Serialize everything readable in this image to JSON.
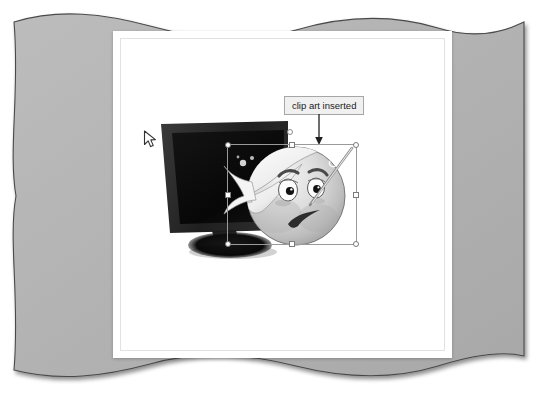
{
  "scene": {
    "kind": "document-page-with-selected-clipart",
    "background_color": "#ffffff",
    "backdrop_color": "#b4b4b4",
    "page_color": "#ffffff",
    "page_border_color": "#e2e2e2"
  },
  "backdrop": {
    "name": "wavy-gray-frame",
    "fill": "#b4b4b4",
    "stroke": "#4d4d4d",
    "edge_style": "wavy"
  },
  "callout": {
    "label": "clip art inserted",
    "fill": "#f0f0f0",
    "border_color": "#a6a6a6",
    "text_color": "#1a1a1a",
    "arrow_color": "#1a1a1a",
    "arrow_direction": "down"
  },
  "selection": {
    "label": "clip-art-selection",
    "border_color": "#9a9a9a",
    "handle_fill": "#ffffff",
    "handle_border": "#7a7a7a",
    "handle_count": 8,
    "handles": [
      {
        "position": "top-left",
        "shape": "circle"
      },
      {
        "position": "top-middle",
        "shape": "square"
      },
      {
        "position": "top-right",
        "shape": "circle"
      },
      {
        "position": "middle-left",
        "shape": "square"
      },
      {
        "position": "middle-right",
        "shape": "square"
      },
      {
        "position": "bottom-left",
        "shape": "circle"
      },
      {
        "position": "bottom-middle",
        "shape": "square"
      },
      {
        "position": "bottom-right",
        "shape": "circle"
      }
    ],
    "bounds": {
      "x": 227,
      "y": 144,
      "width": 130,
      "height": 101
    }
  },
  "artwork": {
    "monitor": {
      "name": "computer-monitor-clipart",
      "bezel_color": "#262626",
      "screen_color": "#0d0d0d",
      "stand_color": "#1a1a1a",
      "description": "dark flat-panel monitor in perspective with oval base"
    },
    "face": {
      "name": "sick-face-clipart",
      "description": "grayscale cartoon face with bandage wrap, worried eyes and frown",
      "skin_light": "#f2f2f2",
      "skin_mid": "#c8c8c8",
      "skin_shadow": "#9e9e9e",
      "bandage_color": "#fbfbfb",
      "outline_color": "#4f4f4f",
      "mouth_color": "#2e2e2e"
    }
  },
  "cursor": {
    "name": "mouse-pointer",
    "x": 143,
    "y": 130,
    "fill": "#ffffff",
    "stroke": "#303030"
  }
}
